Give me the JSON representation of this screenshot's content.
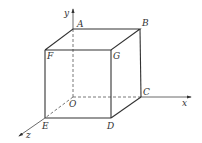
{
  "diagram": {
    "type": "3d-cube-in-coordinate-system",
    "axes": {
      "x": {
        "label": "x"
      },
      "y": {
        "label": "y"
      },
      "z": {
        "label": "z"
      }
    },
    "vertices": {
      "O": {
        "label": "O"
      },
      "A": {
        "label": "A"
      },
      "B": {
        "label": "B"
      },
      "C": {
        "label": "C"
      },
      "D": {
        "label": "D"
      },
      "E": {
        "label": "E"
      },
      "F": {
        "label": "F"
      },
      "G": {
        "label": "G"
      }
    },
    "colors": {
      "line": "#333333",
      "background": "#ffffff"
    }
  }
}
